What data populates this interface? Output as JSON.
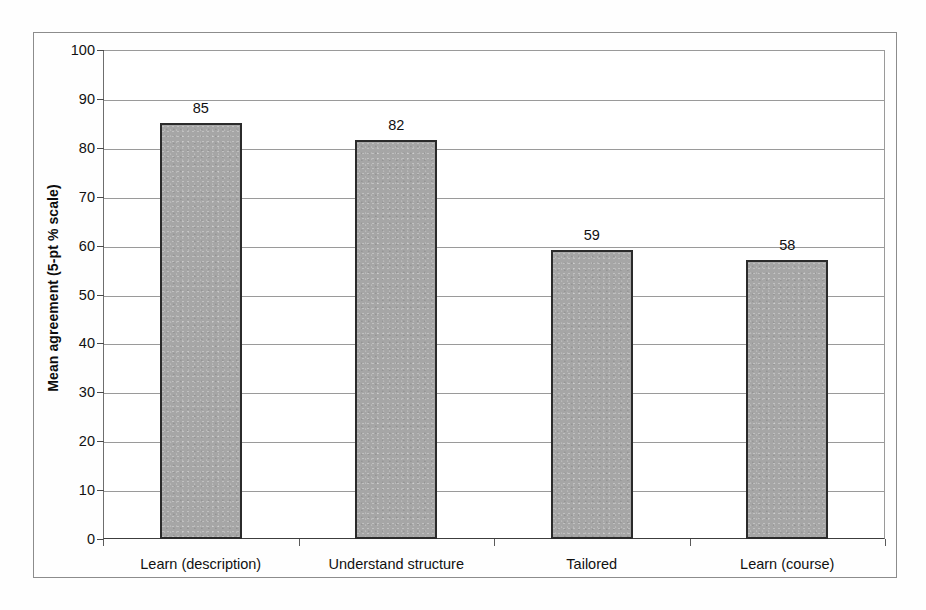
{
  "chart_data": {
    "type": "bar",
    "title": "",
    "subtitle": "",
    "xlabel": "",
    "ylabel": "Mean agreement (5-pt % scale)",
    "categories": [
      "Learn (description)",
      "Understand structure",
      "Tailored",
      "Learn (course)"
    ],
    "values": [
      85,
      82,
      59,
      58
    ],
    "bar_pixel_values": [
      85,
      81.5,
      59,
      57
    ],
    "data_labels": [
      "85",
      "82",
      "59",
      "58"
    ],
    "ylim": [
      0,
      100
    ],
    "ytick_labels": [
      "0",
      "10",
      "20",
      "30",
      "40",
      "50",
      "60",
      "70",
      "80",
      "90",
      "100"
    ],
    "ytick_values": [
      0,
      10,
      20,
      30,
      40,
      50,
      60,
      70,
      80,
      90,
      100
    ],
    "grid": true,
    "grid_axis": "y",
    "legend": false,
    "legend_position": "none",
    "series": [
      {
        "name": "Mean agreement",
        "values": [
          85,
          82,
          59,
          58
        ],
        "fill_color": "#a6a6a6",
        "edge_color": "#2b2b2b"
      }
    ]
  },
  "figure": {
    "frame_color": "#8c8c8c",
    "axis_color": "#3d3d3d",
    "gridline_color": "#9a9a9a",
    "background_color": "#ffffff",
    "text_color": "#111111"
  }
}
